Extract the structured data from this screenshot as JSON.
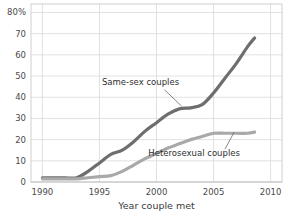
{
  "chart_data": {
    "type": "line",
    "title": "",
    "subtitle": "",
    "xlabel": "Year couple met",
    "ylabel": "",
    "xlim": [
      1989.0,
      2011.0
    ],
    "ylim": [
      0,
      84
    ],
    "grid": true,
    "legend_position": "inline-annotations",
    "x_ticks": [
      1990,
      1995,
      2000,
      2005,
      2010
    ],
    "x_tick_labels": [
      "1990",
      "1995",
      "2000",
      "2005",
      "2010"
    ],
    "y_ticks": [
      0,
      10,
      20,
      30,
      40,
      50,
      60,
      70,
      80
    ],
    "y_tick_labels": [
      "0",
      "10",
      "20",
      "30",
      "40",
      "50",
      "60",
      "70",
      "80%"
    ],
    "series": [
      {
        "name": "Same-sex couples",
        "color": "#6e6e6e",
        "x": [
          1990,
          1991,
          1992,
          1993,
          1994,
          1995,
          1996,
          1997,
          1998,
          1999,
          2000,
          2001,
          2002,
          2003,
          2004,
          2005,
          2006,
          2007,
          2008,
          2008.6
        ],
        "values": [
          2,
          2,
          2,
          2,
          5,
          9,
          13,
          15,
          19,
          24,
          28,
          32,
          34.5,
          35,
          36.5,
          42,
          49,
          56,
          64,
          68
        ]
      },
      {
        "name": "Heterosexual couples",
        "color": "#a9a9a9",
        "x": [
          1990,
          1991,
          1992,
          1993,
          1994,
          1995,
          1996,
          1997,
          1998,
          1999,
          2000,
          2001,
          2002,
          2003,
          2004,
          2005,
          2006,
          2007,
          2008,
          2008.6
        ],
        "values": [
          1.5,
          1.5,
          1.5,
          1.5,
          2,
          2.5,
          3,
          5,
          8,
          11,
          13.5,
          16,
          18,
          20,
          21.5,
          23,
          23,
          23,
          23,
          23.5
        ]
      }
    ],
    "annotations": [
      {
        "text": "Same-sex couples",
        "text_x": 1998.6,
        "text_y": 46,
        "leader_from": [
          2000.7,
          43.5
        ],
        "leader_to": [
          2002.2,
          35.8
        ]
      },
      {
        "text": "Heterosexual couples",
        "text_x": 2003.3,
        "text_y": 12.5,
        "leader_from": [
          2006.0,
          15.5
        ],
        "leader_to": [
          2006.8,
          23.5
        ]
      }
    ],
    "colors": {
      "background": "#ffffff",
      "grid": "#d9d9d9",
      "plot_border": "#cfcfcf",
      "axis_text": "#4a4a4a",
      "annotation_text": "#2e2e2e"
    }
  }
}
